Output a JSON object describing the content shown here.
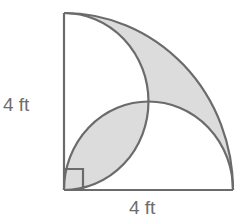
{
  "diagram": {
    "labels": {
      "left_side": "4 ft",
      "bottom_side": "4 ft"
    },
    "geometry": {
      "quarter_circle_radius": 4,
      "semicircle_diameter": 4,
      "units": "ft",
      "right_angle_marker": true
    },
    "colors": {
      "stroke": "#6b6b6b",
      "shade": "#dcdcdc",
      "background": "#ffffff",
      "text": "#6d6d6d"
    }
  }
}
